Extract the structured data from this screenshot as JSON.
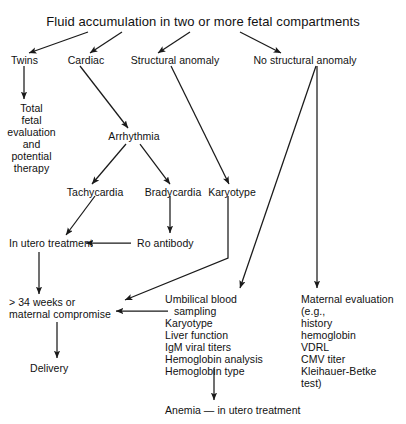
{
  "diagram": {
    "title": "Fluid accumulation in two or more fetal compartments",
    "type": "flowchart",
    "nodes": {
      "root": "Fluid accumulation in two or more fetal compartments",
      "twins": "Twins",
      "cardiac": "Cardiac",
      "structural_anomaly": "Structural anomaly",
      "no_structural_anomaly": "No structural anomaly",
      "total_fetal_eval_l1": "Total",
      "total_fetal_eval_l2": "fetal",
      "total_fetal_eval_l3": "evaluation",
      "total_fetal_eval_l4": "and",
      "total_fetal_eval_l5": "potential",
      "total_fetal_eval_l6": "therapy",
      "arrhythmia": "Arrhythmia",
      "tachycardia": "Tachycardia",
      "bradycardia": "Bradycardia",
      "karyotype": "Karyotype",
      "in_utero_treatment": "In utero treatment",
      "ro_antibody": "Ro antibody",
      "weeks_l1": "> 34 weeks or",
      "weeks_l2": "maternal compromise",
      "delivery": "Delivery",
      "anemia": "Anemia — in utero treatment"
    },
    "umbilical_panel": {
      "lines": [
        "Umbilical blood",
        "   sampling",
        "Karyotype",
        "Liver function",
        "IgM viral titers",
        "Hemoglobin analysis",
        "Hemoglobin type"
      ]
    },
    "maternal_panel": {
      "lines": [
        "Maternal evaluation",
        "(e.g.,",
        "history",
        "hemoglobin",
        "VDRL",
        "CMV titer",
        "Kleihauer-Betke",
        "test)"
      ]
    },
    "colors": {
      "background": "#ffffff",
      "text": "#111111",
      "connector": "#1a1a1a"
    }
  }
}
